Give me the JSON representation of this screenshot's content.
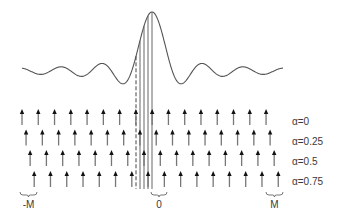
{
  "figure": {
    "curve": {
      "type": "sinc",
      "center_x": 152,
      "baseline_y": 71,
      "amplitude": 59,
      "zero_spacing": 20.3,
      "x_start": 22,
      "x_end": 283
    },
    "sample_lines": {
      "dashed_x": 136,
      "solid_x": [
        140,
        144,
        148,
        152
      ],
      "y_bottom": 189
    },
    "arrows": {
      "first_x": 22,
      "spacing": 16.27,
      "count": 16,
      "length": 16,
      "rows": [
        {
          "label": "α=0",
          "alpha": 0,
          "tip_y": 109
        },
        {
          "label": "α=0.25",
          "alpha": 0.25,
          "tip_y": 129.5
        },
        {
          "label": "α=0.5",
          "alpha": 0.5,
          "tip_y": 150
        },
        {
          "label": "α=0.75",
          "alpha": 0.75,
          "tip_y": 171
        }
      ]
    },
    "axis_labels": [
      {
        "text": "-M",
        "brace_x1": 20,
        "brace_x2": 37
      },
      {
        "text": "0",
        "brace_x1": 151,
        "brace_x2": 167
      },
      {
        "text": "M",
        "brace_x1": 266,
        "brace_x2": 283
      }
    ]
  }
}
